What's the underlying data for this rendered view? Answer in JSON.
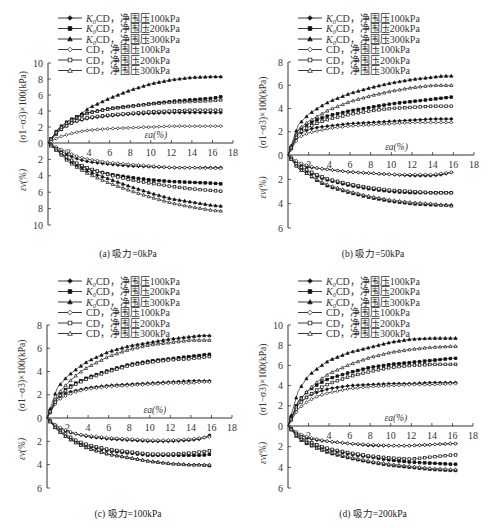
{
  "legend": [
    {
      "label": "K0CD，净围压100kPa",
      "prefix": "K",
      "sub": "0",
      "rest": "CD，净围压100kPa",
      "marker": "diamond",
      "filled": true
    },
    {
      "label": "K0CD，净围压200kPa",
      "prefix": "K",
      "sub": "0",
      "rest": "CD，净围压200kPa",
      "marker": "square",
      "filled": true
    },
    {
      "label": "K0CD，净围压300kPa",
      "prefix": "K",
      "sub": "0",
      "rest": "CD，净围压300kPa",
      "marker": "triangle",
      "filled": true
    },
    {
      "label": "CD，净围压100kPa",
      "prefix": "",
      "sub": "",
      "rest": "CD，净围压100kPa",
      "marker": "diamond",
      "filled": false
    },
    {
      "label": "CD，净围压200kPa",
      "prefix": "",
      "sub": "",
      "rest": "CD，净围压200kPa",
      "marker": "square",
      "filled": false
    },
    {
      "label": "CD，净围压300kPa",
      "prefix": "",
      "sub": "",
      "rest": "CD，净围压300kPa",
      "marker": "triangle",
      "filled": false
    }
  ],
  "axis_labels": {
    "y_upper": "(σ1−σ3)×100(kPa)",
    "y_lower": "εv(%)",
    "x": "εa(%)"
  },
  "captions": {
    "a": "(a) 吸力=0kPa",
    "b": "(b) 吸力=50kPa",
    "c": "(c) 吸力=100kPa",
    "d": "(d) 吸力=200kPa"
  },
  "chart_data": [
    {
      "id": "a",
      "type": "line",
      "title": "(a) 吸力=0kPa",
      "xlabel": "εa(%)",
      "ylabel_upper": "(σ1−σ3)×100(kPa)",
      "ylabel_lower": "εv(%)",
      "xlim": [
        0,
        18
      ],
      "xticks": [
        2,
        4,
        6,
        8,
        10,
        12,
        14,
        16,
        18
      ],
      "ylim_upper": [
        0,
        10
      ],
      "yticks_upper": [
        0,
        2,
        4,
        6,
        8,
        10
      ],
      "ylim_lower": [
        0,
        10
      ],
      "yticks_lower": [
        2,
        4,
        6,
        8,
        10
      ],
      "x": [
        0,
        1,
        2,
        3,
        4,
        6,
        8,
        10,
        12,
        14,
        16,
        17
      ],
      "series": [
        {
          "name": "K0CD，净围压100kPa",
          "stress": [
            0,
            1.6,
            2.4,
            2.8,
            3.1,
            3.4,
            3.6,
            3.7,
            3.8,
            3.8,
            3.8,
            3.8
          ],
          "volumetric": [
            0,
            0.8,
            1.5,
            2.0,
            2.3,
            2.6,
            2.8,
            2.9,
            3.0,
            3.0,
            3.0,
            3.0
          ]
        },
        {
          "name": "K0CD，净围压200kPa",
          "stress": [
            0,
            1.8,
            2.8,
            3.4,
            3.8,
            4.3,
            4.6,
            4.9,
            5.2,
            5.4,
            5.6,
            5.8
          ],
          "volumetric": [
            0,
            1.0,
            2.0,
            2.7,
            3.2,
            3.8,
            4.2,
            4.5,
            4.7,
            4.8,
            4.9,
            5.0
          ]
        },
        {
          "name": "K0CD，净围压300kPa",
          "stress": [
            0,
            1.4,
            2.4,
            3.4,
            4.4,
            5.6,
            6.6,
            7.4,
            7.9,
            8.2,
            8.3,
            8.3
          ],
          "volumetric": [
            0,
            1.0,
            2.1,
            2.9,
            3.5,
            4.4,
            5.3,
            6.1,
            6.8,
            7.2,
            7.6,
            7.7
          ]
        },
        {
          "name": "CD，净围压100kPa",
          "stress": [
            0,
            0.7,
            1.1,
            1.4,
            1.6,
            1.8,
            1.9,
            2.0,
            2.1,
            2.1,
            2.1,
            2.1
          ],
          "volumetric": [
            0,
            0.6,
            1.2,
            1.7,
            2.0,
            2.4,
            2.6,
            2.8,
            3.0,
            3.0,
            3.1,
            3.1
          ]
        },
        {
          "name": "CD，净围压200kPa",
          "stress": [
            0,
            1.5,
            2.3,
            2.9,
            3.2,
            3.5,
            3.7,
            3.9,
            4.0,
            4.1,
            4.1,
            4.1
          ],
          "volumetric": [
            0,
            0.9,
            1.9,
            2.6,
            3.1,
            3.9,
            4.5,
            4.9,
            5.3,
            5.6,
            5.8,
            5.9
          ]
        },
        {
          "name": "CD，净围压300kPa",
          "stress": [
            0,
            1.7,
            2.7,
            3.3,
            3.8,
            4.3,
            4.6,
            4.9,
            5.1,
            5.2,
            5.3,
            5.4
          ],
          "volumetric": [
            0,
            1.1,
            2.3,
            3.1,
            3.8,
            4.9,
            5.8,
            6.6,
            7.3,
            7.8,
            8.2,
            8.3
          ]
        }
      ]
    },
    {
      "id": "b",
      "type": "line",
      "title": "(b) 吸力=50kPa",
      "xlabel": "εa(%)",
      "ylabel_upper": "(σ1−σ3)×100(kPa)",
      "ylabel_lower": "εv(%)",
      "xlim": [
        0,
        18
      ],
      "xticks": [
        2,
        4,
        6,
        8,
        10,
        12,
        14,
        16,
        18
      ],
      "ylim_upper": [
        0,
        8
      ],
      "yticks_upper": [
        0,
        2,
        4,
        6,
        8
      ],
      "ylim_lower": [
        0,
        6
      ],
      "yticks_lower": [
        2,
        4,
        6
      ],
      "x": [
        0,
        1,
        2,
        3,
        4,
        6,
        8,
        10,
        12,
        14,
        15,
        16
      ],
      "series": [
        {
          "name": "K0CD，净围压100kPa",
          "stress": [
            0,
            1.8,
            2.2,
            2.4,
            2.5,
            2.7,
            2.8,
            2.9,
            3.0,
            3.1,
            3.1,
            3.1
          ],
          "volumetric": [
            0,
            0.8,
            1.0,
            1.1,
            1.2,
            1.4,
            1.5,
            1.6,
            1.7,
            1.7,
            1.6,
            1.4
          ]
        },
        {
          "name": "K0CD，净围压200kPa",
          "stress": [
            0,
            2.1,
            2.7,
            3.1,
            3.4,
            3.8,
            4.1,
            4.4,
            4.6,
            4.8,
            4.9,
            5.0
          ],
          "volumetric": [
            0,
            1.0,
            1.4,
            1.8,
            2.1,
            2.5,
            2.8,
            3.0,
            3.1,
            3.1,
            3.1,
            3.1
          ]
        },
        {
          "name": "K0CD，净围压300kPa",
          "stress": [
            0,
            2.6,
            3.5,
            4.1,
            4.6,
            5.3,
            5.8,
            6.2,
            6.5,
            6.7,
            6.8,
            6.8
          ],
          "volumetric": [
            0,
            1.1,
            1.6,
            2.2,
            2.6,
            3.1,
            3.5,
            3.8,
            4.0,
            4.1,
            4.1,
            4.1
          ]
        },
        {
          "name": "CD，净围压100kPa",
          "stress": [
            0,
            1.5,
            1.9,
            2.1,
            2.3,
            2.5,
            2.6,
            2.7,
            2.8,
            2.8,
            2.8,
            2.8
          ],
          "volumetric": [
            0,
            0.6,
            0.9,
            1.1,
            1.2,
            1.4,
            1.5,
            1.6,
            1.6,
            1.6,
            1.5,
            1.4
          ]
        },
        {
          "name": "CD，净围压200kPa",
          "stress": [
            0,
            1.9,
            2.4,
            2.8,
            3.1,
            3.5,
            3.8,
            4.0,
            4.1,
            4.2,
            4.2,
            4.2
          ],
          "volumetric": [
            0,
            0.9,
            1.3,
            1.7,
            2.0,
            2.4,
            2.7,
            2.9,
            3.0,
            3.1,
            3.1,
            3.1
          ]
        },
        {
          "name": "CD，净围压300kPa",
          "stress": [
            0,
            2.2,
            2.9,
            3.4,
            3.9,
            4.6,
            5.1,
            5.5,
            5.8,
            6.0,
            6.0,
            6.0
          ],
          "volumetric": [
            0,
            1.1,
            1.6,
            2.1,
            2.5,
            3.0,
            3.4,
            3.7,
            3.9,
            4.0,
            4.1,
            4.2
          ]
        }
      ]
    },
    {
      "id": "c",
      "type": "line",
      "title": "(c) 吸力=100kPa",
      "xlabel": "εa(%)",
      "ylabel_upper": "(σ1−σ3)×100(kPa)",
      "ylabel_lower": "εv(%)",
      "xlim": [
        0,
        18
      ],
      "xticks": [
        2,
        4,
        6,
        8,
        10,
        12,
        14,
        16,
        18
      ],
      "ylim_upper": [
        0,
        8
      ],
      "yticks_upper": [
        0,
        2,
        4,
        6,
        8
      ],
      "ylim_lower": [
        0,
        6
      ],
      "yticks_lower": [
        2,
        4,
        6
      ],
      "x": [
        0,
        1,
        2,
        3,
        4,
        6,
        8,
        10,
        12,
        14,
        15,
        16
      ],
      "series": [
        {
          "name": "K0CD，净围压100kPa",
          "stress": [
            0,
            1.7,
            2.2,
            2.4,
            2.6,
            2.8,
            2.9,
            3.0,
            3.1,
            3.2,
            3.2,
            3.2
          ],
          "volumetric": [
            0,
            0.8,
            1.2,
            1.4,
            1.6,
            1.8,
            1.9,
            2.0,
            2.0,
            1.9,
            1.8,
            1.4
          ]
        },
        {
          "name": "K0CD，净围压200kPa",
          "stress": [
            0,
            1.8,
            2.6,
            3.1,
            3.5,
            4.1,
            4.6,
            4.9,
            5.1,
            5.3,
            5.4,
            5.5
          ],
          "volumetric": [
            0,
            1.0,
            1.6,
            2.1,
            2.4,
            2.8,
            3.0,
            3.2,
            3.2,
            3.2,
            3.2,
            3.1
          ]
        },
        {
          "name": "K0CD，净围压300kPa",
          "stress": [
            0,
            2.6,
            3.6,
            4.3,
            4.9,
            5.7,
            6.2,
            6.5,
            6.8,
            7.0,
            7.1,
            7.1
          ],
          "volumetric": [
            0,
            1.0,
            1.7,
            2.2,
            2.6,
            3.1,
            3.4,
            3.7,
            3.9,
            4.0,
            4.0,
            4.1
          ]
        },
        {
          "name": "CD，净围压100kPa",
          "stress": [
            0,
            1.5,
            2.0,
            2.3,
            2.5,
            2.7,
            2.8,
            2.9,
            3.0,
            3.0,
            3.1,
            3.1
          ],
          "volumetric": [
            0,
            0.7,
            1.1,
            1.4,
            1.5,
            1.7,
            1.8,
            1.9,
            1.9,
            1.8,
            1.7,
            1.6
          ]
        },
        {
          "name": "CD，净围压200kPa",
          "stress": [
            0,
            1.7,
            2.5,
            3.0,
            3.4,
            4.0,
            4.5,
            4.8,
            5.0,
            5.1,
            5.2,
            5.3
          ],
          "volumetric": [
            0,
            0.9,
            1.5,
            2.0,
            2.3,
            2.7,
            2.9,
            3.1,
            3.1,
            3.0,
            2.9,
            2.8
          ]
        },
        {
          "name": "CD，净围压300kPa",
          "stress": [
            0,
            2.0,
            3.0,
            3.8,
            4.4,
            5.3,
            5.9,
            6.3,
            6.5,
            6.7,
            6.7,
            6.7
          ],
          "volumetric": [
            0,
            1.0,
            1.7,
            2.2,
            2.6,
            3.1,
            3.4,
            3.7,
            3.9,
            4.0,
            4.0,
            4.0
          ]
        }
      ]
    },
    {
      "id": "d",
      "type": "line",
      "title": "(d) 吸力=200kPa",
      "xlabel": "εa(%)",
      "ylabel_upper": "(σ1−σ3)×100(kPa)",
      "ylabel_lower": "εv(%)",
      "xlim": [
        0,
        18
      ],
      "xticks": [
        2,
        4,
        6,
        8,
        10,
        12,
        14,
        16,
        18
      ],
      "ylim_upper": [
        0,
        10
      ],
      "yticks_upper": [
        0,
        2,
        4,
        6,
        8,
        10
      ],
      "ylim_lower": [
        0,
        6
      ],
      "yticks_lower": [
        2,
        4,
        6
      ],
      "x": [
        0,
        1,
        2,
        3,
        4,
        6,
        8,
        10,
        12,
        14,
        16,
        16.5
      ],
      "series": [
        {
          "name": "K0CD，净围压100kPa",
          "stress": [
            0,
            2.2,
            3.0,
            3.4,
            3.7,
            4.0,
            4.1,
            4.2,
            4.2,
            4.3,
            4.3,
            4.3
          ],
          "volumetric": [
            0,
            0.8,
            1.2,
            1.4,
            1.5,
            1.7,
            1.9,
            1.9,
            1.9,
            1.8,
            1.7,
            1.7
          ]
        },
        {
          "name": "K0CD，净围压200kPa",
          "stress": [
            0,
            2.5,
            3.5,
            4.2,
            4.7,
            5.3,
            5.8,
            6.1,
            6.3,
            6.5,
            6.7,
            6.7
          ],
          "volumetric": [
            0,
            1.0,
            1.6,
            2.0,
            2.3,
            2.7,
            3.0,
            3.3,
            3.5,
            3.6,
            3.7,
            3.7
          ]
        },
        {
          "name": "K0CD，净围压300kPa",
          "stress": [
            0,
            3.5,
            5.0,
            5.8,
            6.5,
            7.3,
            7.8,
            8.3,
            8.6,
            8.7,
            8.7,
            8.7
          ],
          "volumetric": [
            0,
            1.2,
            1.8,
            2.2,
            2.6,
            3.1,
            3.5,
            3.8,
            4.0,
            4.2,
            4.3,
            4.3
          ]
        },
        {
          "name": "CD，净围压100kPa",
          "stress": [
            0,
            1.7,
            2.5,
            3.0,
            3.3,
            3.7,
            3.9,
            4.0,
            4.1,
            4.1,
            4.2,
            4.2
          ],
          "volumetric": [
            0,
            0.7,
            1.1,
            1.3,
            1.5,
            1.7,
            1.8,
            1.9,
            1.9,
            1.8,
            1.7,
            1.7
          ]
        },
        {
          "name": "CD，净围压200kPa",
          "stress": [
            0,
            2.1,
            3.0,
            3.7,
            4.2,
            4.9,
            5.4,
            5.8,
            6.0,
            6.1,
            6.1,
            6.1
          ],
          "volumetric": [
            0,
            0.9,
            1.5,
            1.9,
            2.2,
            2.6,
            2.9,
            3.1,
            3.2,
            3.0,
            2.8,
            2.8
          ]
        },
        {
          "name": "CD，净围压300kPa",
          "stress": [
            0,
            2.4,
            3.6,
            4.5,
            5.2,
            6.1,
            6.8,
            7.3,
            7.6,
            7.8,
            7.9,
            7.9
          ],
          "volumetric": [
            0,
            1.1,
            1.7,
            2.2,
            2.5,
            3.0,
            3.4,
            3.7,
            3.9,
            4.1,
            4.2,
            4.2
          ]
        }
      ]
    }
  ]
}
